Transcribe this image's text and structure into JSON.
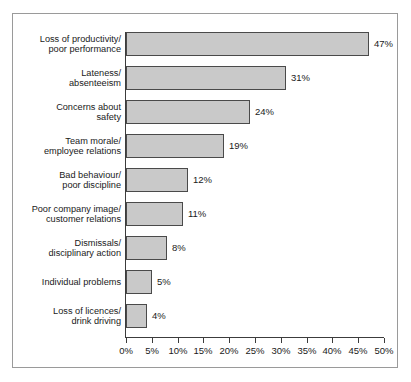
{
  "chart_data": {
    "type": "bar",
    "orientation": "horizontal",
    "title": "",
    "xlabel": "",
    "ylabel": "",
    "xlim": [
      0,
      50
    ],
    "grid": false,
    "legend": null,
    "xticks": [
      "0%",
      "5%",
      "10%",
      "15%",
      "20%",
      "25%",
      "30%",
      "35%",
      "40%",
      "45%",
      "50%"
    ],
    "xtick_values": [
      0,
      5,
      10,
      15,
      20,
      25,
      30,
      35,
      40,
      45,
      50
    ],
    "categories": [
      "Loss of productivity/\npoor performance",
      "Lateness/\nabsenteeism",
      "Concerns about\nsafety",
      "Team morale/\nemployee relations",
      "Bad behaviour/\npoor discipline",
      "Poor company image/\ncustomer relations",
      "Dismissals/\ndisciplinary action",
      "Individual problems",
      "Loss of licences/\ndrink driving"
    ],
    "values": [
      47,
      31,
      24,
      19,
      12,
      11,
      8,
      5,
      4
    ],
    "value_labels": [
      "47%",
      "31%",
      "24%",
      "19%",
      "12%",
      "11%",
      "8%",
      "5%",
      "4%"
    ],
    "colors": {
      "bar_fill": "#c9c9c9",
      "bar_border": "#4a4a4a",
      "axis": "#3c3c3c",
      "frame": "#9a9a9a",
      "background": "#ffffff",
      "text": "#1a1a1a"
    }
  }
}
